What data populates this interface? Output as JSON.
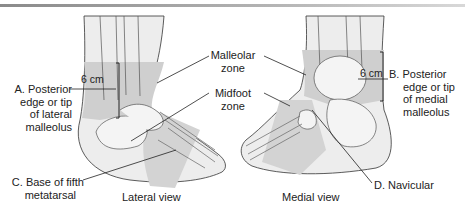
{
  "figure": {
    "labels": {
      "malleolar_zone": [
        "Malleolar",
        "zone"
      ],
      "midfoot_zone": [
        "Midfoot",
        "zone"
      ],
      "a_posterior": [
        "A. Posterior",
        "edge or tip",
        "of lateral",
        "malleolus"
      ],
      "b_posterior": [
        "B. Posterior",
        "edge or tip",
        "of medial",
        "malleolus"
      ],
      "c_base": [
        "C. Base of fifth",
        "metatarsal"
      ],
      "d_navicular": "D. Navicular",
      "measure_left": "6 cm",
      "measure_right": "6 cm",
      "lateral_view": "Lateral view",
      "medial_view": "Medial view"
    },
    "colors": {
      "zone_shade": "#c9c9c9",
      "bone": "#ececec",
      "outline": "#333333",
      "skin": "#e4e4e4"
    }
  }
}
